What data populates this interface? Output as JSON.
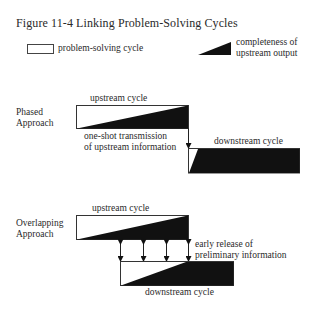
{
  "figure": {
    "title": "Figure 11-4   Linking Problem-Solving Cycles"
  },
  "legend": {
    "box_label": "problem-solving cycle",
    "triangle_label_line1": "completeness of",
    "triangle_label_line2": "upstream output"
  },
  "phased": {
    "label_line1": "Phased",
    "label_line2": "Approach",
    "upstream_label": "upstream cycle",
    "downstream_label": "downstream cycle",
    "transmission_line1": "one-shot transmission",
    "transmission_line2": "of upstream information"
  },
  "overlapping": {
    "label_line1": "Overlapping",
    "label_line2": "Approach",
    "upstream_label": "upstream cycle",
    "downstream_label": "downstream cycle",
    "release_line1": "early release of",
    "release_line2": "preliminary information"
  },
  "colors": {
    "ink": "#111111",
    "text": "#2a2a2a",
    "background": "#ffffff"
  }
}
